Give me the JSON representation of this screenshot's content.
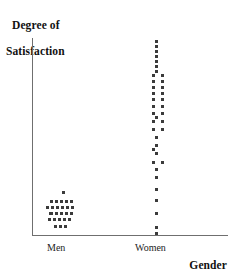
{
  "chart_data": {
    "type": "scatter",
    "title": "",
    "ylabel": "Degree of Satisfaction",
    "xlabel": "Gender",
    "categories": [
      "Men",
      "Women"
    ],
    "grid": false,
    "legend": "none",
    "axis_labels": {
      "y_line1": "Degree of",
      "y_line2": "Satisfaction",
      "x": "Gender"
    },
    "tick_labels": {
      "men": "Men",
      "women": "Women"
    },
    "series": [
      {
        "name": "Men",
        "point_count": 26,
        "points": [
          {
            "x": 62,
            "y": 191
          },
          {
            "x": 50,
            "y": 200
          },
          {
            "x": 55,
            "y": 200
          },
          {
            "x": 60,
            "y": 200
          },
          {
            "x": 65,
            "y": 200
          },
          {
            "x": 70,
            "y": 200
          },
          {
            "x": 46,
            "y": 206
          },
          {
            "x": 51,
            "y": 206
          },
          {
            "x": 56,
            "y": 206
          },
          {
            "x": 61,
            "y": 206
          },
          {
            "x": 66,
            "y": 206
          },
          {
            "x": 71,
            "y": 206
          },
          {
            "x": 50,
            "y": 212
          },
          {
            "x": 55,
            "y": 212
          },
          {
            "x": 60,
            "y": 212
          },
          {
            "x": 65,
            "y": 212
          },
          {
            "x": 48,
            "y": 218
          },
          {
            "x": 53,
            "y": 218
          },
          {
            "x": 58,
            "y": 218
          },
          {
            "x": 63,
            "y": 218
          },
          {
            "x": 68,
            "y": 218
          },
          {
            "x": 54,
            "y": 225
          },
          {
            "x": 59,
            "y": 225
          },
          {
            "x": 64,
            "y": 225
          },
          {
            "x": 49,
            "y": 212
          },
          {
            "x": 70,
            "y": 212
          }
        ]
      },
      {
        "name": "Women",
        "point_count": 41,
        "points": [
          {
            "x": 155,
            "y": 40
          },
          {
            "x": 155,
            "y": 45
          },
          {
            "x": 155,
            "y": 50
          },
          {
            "x": 155,
            "y": 55
          },
          {
            "x": 155,
            "y": 60
          },
          {
            "x": 155,
            "y": 65
          },
          {
            "x": 152,
            "y": 74
          },
          {
            "x": 161,
            "y": 74
          },
          {
            "x": 152,
            "y": 80
          },
          {
            "x": 161,
            "y": 80
          },
          {
            "x": 152,
            "y": 86
          },
          {
            "x": 161,
            "y": 86
          },
          {
            "x": 152,
            "y": 92
          },
          {
            "x": 161,
            "y": 92
          },
          {
            "x": 152,
            "y": 98
          },
          {
            "x": 161,
            "y": 98
          },
          {
            "x": 152,
            "y": 105
          },
          {
            "x": 161,
            "y": 105
          },
          {
            "x": 152,
            "y": 112
          },
          {
            "x": 161,
            "y": 112
          },
          {
            "x": 152,
            "y": 120
          },
          {
            "x": 161,
            "y": 120
          },
          {
            "x": 152,
            "y": 128
          },
          {
            "x": 161,
            "y": 128
          },
          {
            "x": 155,
            "y": 136
          },
          {
            "x": 155,
            "y": 144
          },
          {
            "x": 155,
            "y": 152
          },
          {
            "x": 152,
            "y": 161
          },
          {
            "x": 161,
            "y": 161
          },
          {
            "x": 155,
            "y": 176
          },
          {
            "x": 155,
            "y": 188
          },
          {
            "x": 155,
            "y": 199
          },
          {
            "x": 155,
            "y": 212
          },
          {
            "x": 155,
            "y": 226
          },
          {
            "x": 155,
            "y": 232
          },
          {
            "x": 152,
            "y": 92
          },
          {
            "x": 161,
            "y": 92
          },
          {
            "x": 155,
            "y": 70
          },
          {
            "x": 155,
            "y": 116
          },
          {
            "x": 152,
            "y": 148
          },
          {
            "x": 155,
            "y": 168
          }
        ]
      }
    ]
  },
  "colors": {
    "axis": "#6f6f6f",
    "dot": "#3b3b3b",
    "text": "#111111",
    "background": "#ffffff"
  }
}
